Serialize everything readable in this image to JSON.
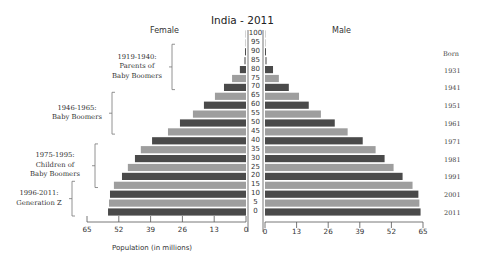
{
  "chart_data": {
    "type": "bar",
    "subtype": "population-pyramid",
    "title": "India - 2011",
    "orientation": "horizontal",
    "xlabel": "Population (in millions)",
    "ylabel": "Age",
    "xlim": [
      0,
      65
    ],
    "grid": false,
    "categories": [
      "0",
      "5",
      "10",
      "15",
      "20",
      "25",
      "30",
      "35",
      "40",
      "45",
      "50",
      "55",
      "60",
      "65",
      "70",
      "75",
      "80",
      "85",
      "90",
      "95",
      "100"
    ],
    "series": [
      {
        "name": "Female",
        "side": "left",
        "values": [
          56.4,
          56.0,
          55.6,
          54.0,
          50.7,
          48.3,
          45.4,
          43.0,
          38.4,
          31.9,
          27.0,
          21.7,
          17.2,
          12.7,
          9.0,
          5.7,
          2.5,
          0.8,
          0.4,
          0.2,
          0.1
        ]
      },
      {
        "name": "Male",
        "side": "right",
        "values": [
          64.0,
          63.5,
          63.1,
          60.7,
          56.6,
          52.9,
          49.2,
          45.5,
          40.2,
          34.0,
          28.7,
          23.0,
          18.0,
          14.0,
          9.8,
          5.7,
          3.3,
          0.8,
          0.4,
          0.2,
          0.1
        ]
      }
    ],
    "x_ticks_left": [
      "65",
      "52",
      "39",
      "26",
      "13",
      "0"
    ],
    "x_ticks_right": [
      "0",
      "13",
      "26",
      "39",
      "52",
      "65"
    ],
    "y_ticks": [
      "100",
      "95",
      "90",
      "85",
      "80",
      "75",
      "70",
      "65",
      "60",
      "55",
      "50",
      "45",
      "40",
      "35",
      "30",
      "25",
      "20",
      "15",
      "10",
      "5",
      "0"
    ],
    "colors": {
      "dark": "#4a4a4a",
      "light": "#9e9e9e"
    },
    "born_axis": {
      "title": "Born",
      "labels": [
        {
          "year": "1931",
          "age": 80
        },
        {
          "year": "1941",
          "age": 70
        },
        {
          "year": "1951",
          "age": 60
        },
        {
          "year": "1961",
          "age": 50
        },
        {
          "year": "1971",
          "age": 40
        },
        {
          "year": "1981",
          "age": 30
        },
        {
          "year": "1991",
          "age": 20
        },
        {
          "year": "2001",
          "age": 10
        },
        {
          "year": "2011",
          "age": 0
        }
      ]
    },
    "annotations": [
      {
        "lines": [
          "1919-1940:",
          "Parents of",
          "Baby Boomers"
        ],
        "age_range": [
          71,
          92
        ]
      },
      {
        "lines": [
          "1946-1965:",
          "Baby Boomers"
        ],
        "age_range": [
          46,
          65
        ]
      },
      {
        "lines": [
          "1975-1995:",
          "Children of",
          "Baby Boomers"
        ],
        "age_range": [
          16,
          36
        ]
      },
      {
        "lines": [
          "1996-2011:",
          "Generation Z"
        ],
        "age_range": [
          0,
          15
        ]
      }
    ]
  },
  "labels": {
    "title": "India - 2011",
    "female": "Female",
    "male": "Male",
    "born": "Born",
    "xaxis": "Population (in millions)"
  }
}
